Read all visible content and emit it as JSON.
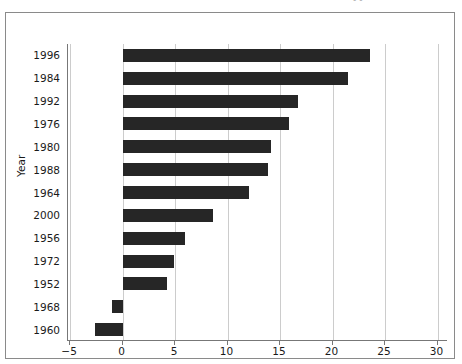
{
  "figure": {
    "top_artifact_text": "••",
    "background_color": "#ffffff",
    "frame_color": "#8a8a8a",
    "axis_color": "#777777",
    "grid_color": "#cccccc",
    "bar_color": "#262626"
  },
  "chart_data": {
    "type": "bar",
    "orientation": "horizontal",
    "title": "",
    "xlabel": "",
    "ylabel": "Year",
    "categories": [
      "1996",
      "1984",
      "1992",
      "1976",
      "1980",
      "1988",
      "1964",
      "2000",
      "1956",
      "1972",
      "1952",
      "1968",
      "1960"
    ],
    "values": [
      23.6,
      21.5,
      16.7,
      15.9,
      14.1,
      13.9,
      12.0,
      8.6,
      5.9,
      4.9,
      4.2,
      -1.0,
      -2.6
    ],
    "xlim": [
      -5.2,
      31.0
    ],
    "xticks": [
      -5,
      0,
      5,
      10,
      15,
      20,
      25,
      30
    ],
    "xticklabels": [
      "−5",
      "0",
      "5",
      "10",
      "15",
      "20",
      "25",
      "30"
    ],
    "grid": "vertical",
    "legend": "none"
  }
}
